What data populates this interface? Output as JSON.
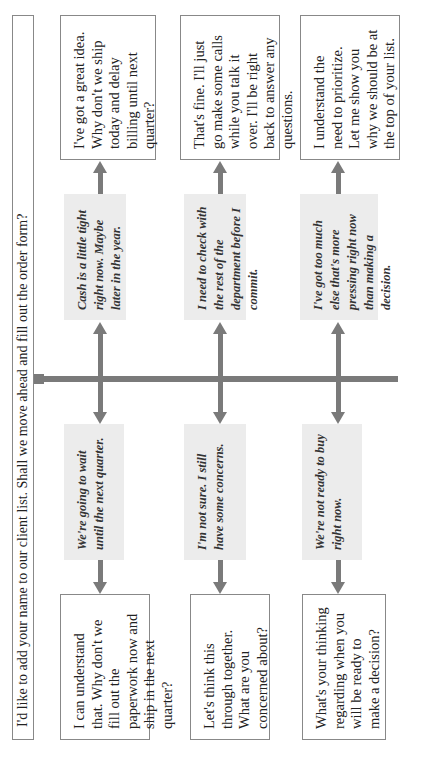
{
  "title_prompt": "I'd like to add your name to our client list. Shall we move ahead and fill out the order form?",
  "orientation": "rotated 90 degrees counter-clockwise",
  "colors": {
    "arrow": "#7a7a7a",
    "objection_box_bg": "#ececec",
    "response_box_border": "#888888"
  },
  "branches": [
    {
      "objection_left": "We're going to wait until the next quarter.",
      "response_left": "I can understand that. Why don't we fill out the paperwork now and ship in the next quarter?",
      "objection_right": "Cash is a little tight right now. Maybe later in the year.",
      "response_right": "I've got a great idea. Why don't we ship today and delay billing until next quarter?"
    },
    {
      "objection_left": "I'm not sure. I still have some concerns.",
      "response_left": "Let's think this through together. What are you concerned about?",
      "objection_right": "I need to check with the rest of the department before I commit.",
      "response_right": "That's fine. I'll just go make some calls while you talk it over. I'll be right back to answer any questions."
    },
    {
      "objection_left": "We're not ready to buy right now.",
      "response_left": "What's your thinking regarding when you will be ready to make a decision?",
      "objection_right": "I've got too much else that's more pressing right now than making a decision.",
      "response_right": "I understand the need to prioritize. Let me show you why we should be at the top of your list."
    }
  ]
}
